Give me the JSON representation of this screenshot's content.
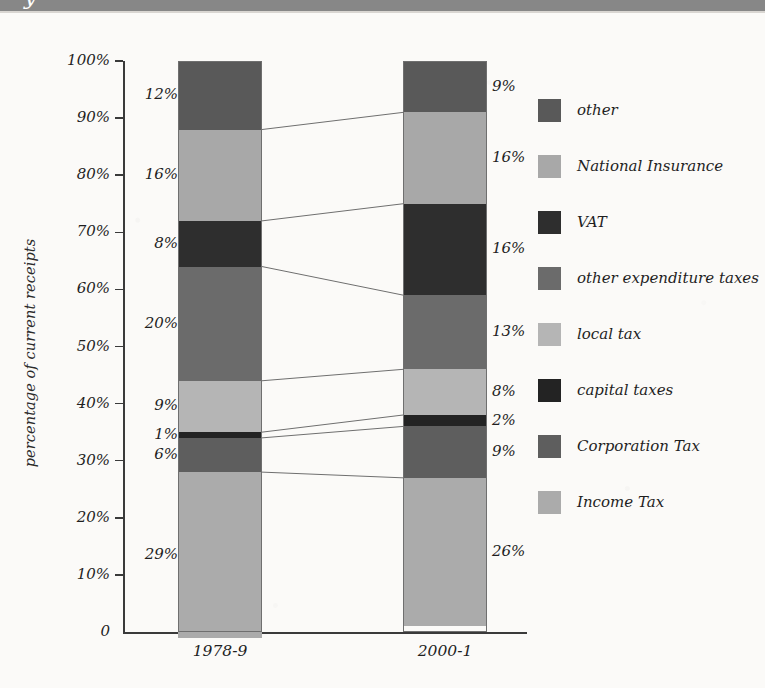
{
  "header": {
    "band_color": "#878787",
    "cutoff_glyph": "y"
  },
  "chart_data": {
    "type": "bar",
    "subtype": "stacked-100-percent",
    "title": "",
    "xlabel": "",
    "ylabel": "percentage of current receipts",
    "ylim": [
      0,
      100
    ],
    "ytick_labels": [
      "0",
      "10%",
      "20%",
      "30%",
      "40%",
      "50%",
      "60%",
      "70%",
      "80%",
      "90%",
      "100%"
    ],
    "ytick_values": [
      0,
      10,
      20,
      30,
      40,
      50,
      60,
      70,
      80,
      90,
      100
    ],
    "grid": false,
    "legend_position": "right",
    "categories": [
      "1978-9",
      "2000-1"
    ],
    "series": [
      {
        "name": "other",
        "color": "#595959",
        "values": [
          12,
          9
        ],
        "labels": [
          "12%",
          "9%"
        ]
      },
      {
        "name": "National Insurance",
        "color": "#a8a8a8",
        "values": [
          16,
          16
        ],
        "labels": [
          "16%",
          "16%"
        ]
      },
      {
        "name": "VAT",
        "color": "#2e2e2e",
        "values": [
          8,
          16
        ],
        "labels": [
          "8%",
          "16%"
        ]
      },
      {
        "name": "other expenditure taxes",
        "color": "#6b6b6b",
        "values": [
          20,
          13
        ],
        "labels": [
          "20%",
          "13%"
        ]
      },
      {
        "name": "local tax",
        "color": "#b5b5b5",
        "values": [
          9,
          8
        ],
        "labels": [
          "9%",
          "8%"
        ]
      },
      {
        "name": "capital taxes",
        "color": "#232323",
        "values": [
          1,
          2
        ],
        "labels": [
          "1%",
          "2%"
        ]
      },
      {
        "name": "Corporation Tax",
        "color": "#5e5e5e",
        "values": [
          6,
          9
        ],
        "labels": [
          "6%",
          "9%"
        ]
      },
      {
        "name": "Income Tax",
        "color": "#ababab",
        "values": [
          29,
          26
        ],
        "labels": [
          "29%",
          "26%"
        ]
      }
    ]
  },
  "legend": {
    "entries": [
      {
        "label": "other",
        "color": "#595959"
      },
      {
        "label": "National Insurance",
        "color": "#a8a8a8"
      },
      {
        "label": "VAT",
        "color": "#2e2e2e"
      },
      {
        "label": "other expenditure taxes",
        "color": "#6b6b6b"
      },
      {
        "label": "local tax",
        "color": "#b5b5b5"
      },
      {
        "label": "capital taxes",
        "color": "#232323"
      },
      {
        "label": "Corporation Tax",
        "color": "#5e5e5e"
      },
      {
        "label": "Income Tax",
        "color": "#ababab"
      }
    ]
  }
}
